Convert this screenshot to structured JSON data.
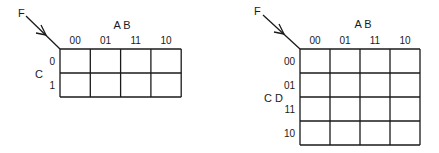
{
  "maps": [
    {
      "id": "kmap-3var",
      "function_label": "F",
      "column_variables": "A B",
      "row_variables": "C",
      "column_headers": [
        "00",
        "01",
        "11",
        "10"
      ],
      "row_headers": [
        "0",
        "1"
      ],
      "cells": [
        [
          "",
          "",
          "",
          ""
        ],
        [
          "",
          "",
          "",
          ""
        ]
      ]
    },
    {
      "id": "kmap-4var",
      "function_label": "F",
      "column_variables": "A B",
      "row_variables": "C D",
      "column_headers": [
        "00",
        "01",
        "11",
        "10"
      ],
      "row_headers": [
        "00",
        "01",
        "11",
        "10"
      ],
      "cells": [
        [
          "",
          "",
          "",
          ""
        ],
        [
          "",
          "",
          "",
          ""
        ],
        [
          "",
          "",
          "",
          ""
        ],
        [
          "",
          "",
          "",
          ""
        ]
      ]
    }
  ]
}
